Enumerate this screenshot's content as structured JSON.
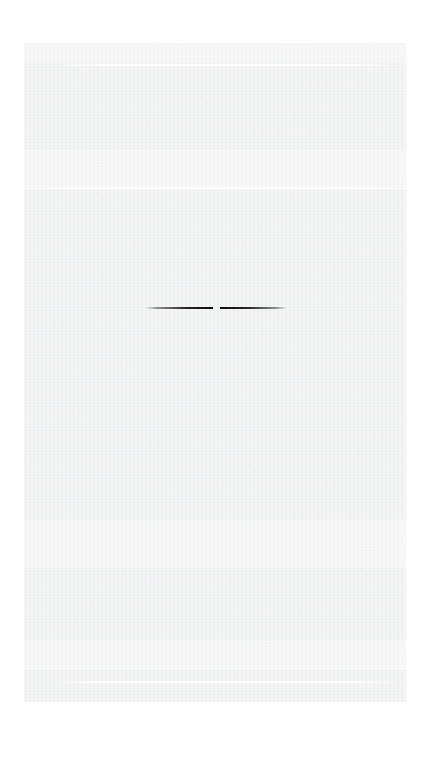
{
  "document": {
    "kind": "faded-scanned-page",
    "background_color": "#ffffff",
    "page_color": "#eeeff0",
    "page_rect": {
      "x": 24,
      "y": 43,
      "width": 382,
      "height": 659
    },
    "legible_text": "",
    "note": "Page is almost entirely blank / overexposed; no legible text renders at this exposure."
  },
  "rules": {
    "white_top": {
      "label": "",
      "x": 62,
      "y": 64,
      "width": 330,
      "height": 2
    },
    "white_mid": {
      "label": "",
      "x": 40,
      "y": 187,
      "width": 360,
      "height": 2
    },
    "white_bottom": {
      "label": "",
      "x": 60,
      "y": 681,
      "width": 332,
      "height": 2
    },
    "dark_center": {
      "label": "",
      "x": 145,
      "y": 305,
      "width": 142,
      "height": 6,
      "color": "#151515"
    }
  },
  "wash_bands": [
    {
      "label": "",
      "y": 43,
      "height": 20
    },
    {
      "label": "",
      "y": 150,
      "height": 40
    },
    {
      "label": "",
      "y": 520,
      "height": 48
    },
    {
      "label": "",
      "y": 640,
      "height": 30
    }
  ],
  "ghost_text": {
    "band_top": {
      "text": " ",
      "x": 50,
      "y": 56,
      "size": 13,
      "spacing": 2
    },
    "band_upper": {
      "text": " ",
      "x": 30,
      "y": 100,
      "size": 11,
      "spacing": 3
    },
    "band_lower": {
      "text": " ",
      "x": 34,
      "y": 560,
      "size": 11,
      "spacing": 3
    },
    "band_bottom": {
      "text": " ",
      "x": 44,
      "y": 660,
      "size": 11,
      "spacing": 3
    }
  }
}
